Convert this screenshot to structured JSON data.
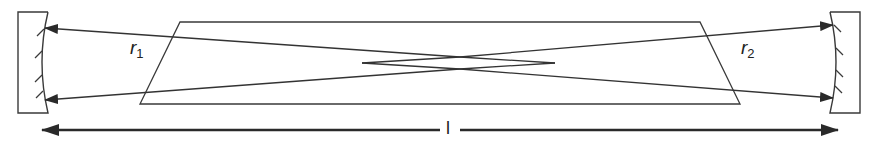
{
  "diagram": {
    "type": "optical resonator with crystal",
    "labels": {
      "r1_main": "r",
      "r1_sub": "1",
      "r2_main": "r",
      "r2_sub": "2",
      "length": "l"
    },
    "elements": [
      {
        "name": "left-curved-mirror",
        "role": "mirror with radius r1"
      },
      {
        "name": "right-curved-mirror",
        "role": "mirror with radius r2"
      },
      {
        "name": "trapezoidal-crystal",
        "role": "gain medium / crystal"
      },
      {
        "name": "beam-paths",
        "role": "crossed beams forming a waist"
      },
      {
        "name": "cavity-length-arrow",
        "role": "double-headed dimension arrow labeled l"
      }
    ],
    "colors": {
      "stroke": "#2a2a2a",
      "background": "#ffffff"
    }
  }
}
